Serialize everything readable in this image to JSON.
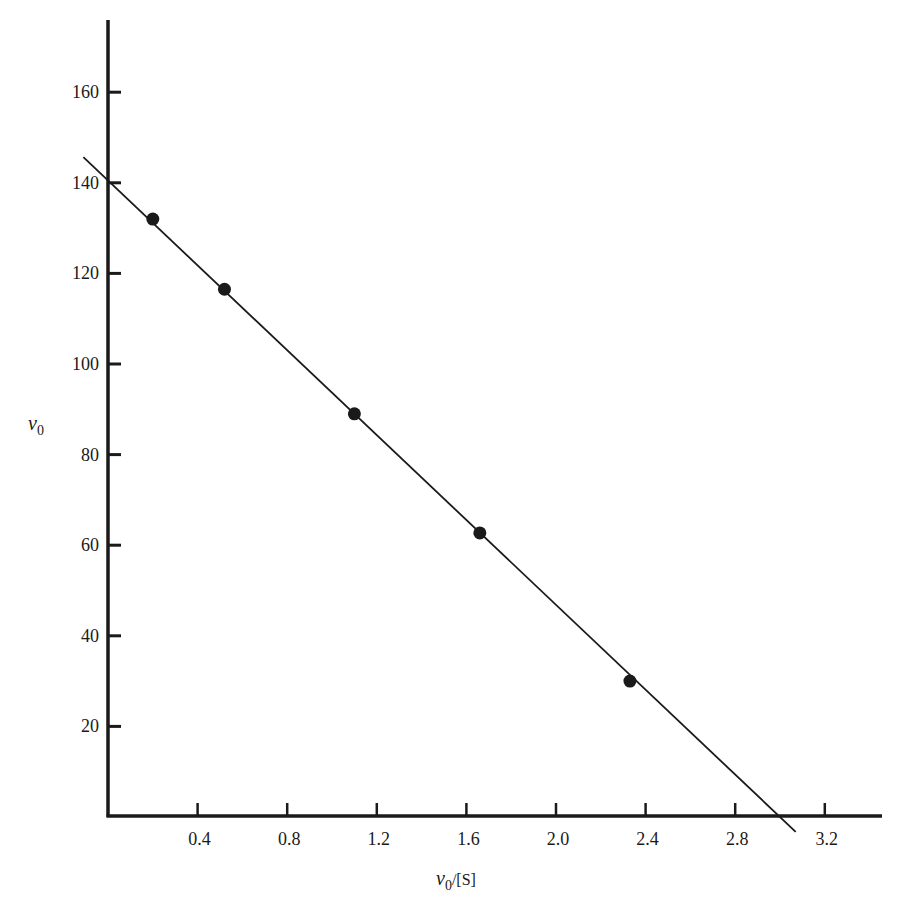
{
  "chart_data": {
    "type": "scatter",
    "title": "",
    "xlabel": "v0/[S]",
    "ylabel": "v0",
    "xlabel_parts": {
      "var": "v",
      "sub": "0",
      "rest": "/[S]"
    },
    "ylabel_parts": {
      "var": "v",
      "sub": "0"
    },
    "xlim": [
      0,
      3.4
    ],
    "ylim": [
      0,
      170
    ],
    "x_ticks": [
      0.4,
      0.8,
      1.2,
      1.6,
      2.0,
      2.4,
      2.8,
      3.2
    ],
    "x_tick_labels": [
      "0.4",
      "0.8",
      "1.2",
      "1.6",
      "2.0",
      "2.4",
      "2.8",
      "3.2"
    ],
    "y_ticks": [
      20,
      40,
      60,
      80,
      100,
      120,
      140,
      160
    ],
    "y_tick_labels": [
      "20",
      "40",
      "60",
      "80",
      "100",
      "120",
      "140",
      "160"
    ],
    "grid": false,
    "legend": null,
    "series": [
      {
        "name": "data points",
        "marker": "filled-circle",
        "x": [
          0.2,
          0.52,
          1.1,
          1.66,
          2.33
        ],
        "y": [
          132,
          116.5,
          89,
          62.7,
          30
        ]
      }
    ],
    "fit_line": {
      "name": "linear fit",
      "y_intercept": 140.5,
      "x_intercept": 3.0,
      "slope": -46.8,
      "x_range": [
        -0.11,
        3.07
      ]
    },
    "colors": {
      "ink": "#1a1a1a",
      "background": "#ffffff"
    }
  }
}
